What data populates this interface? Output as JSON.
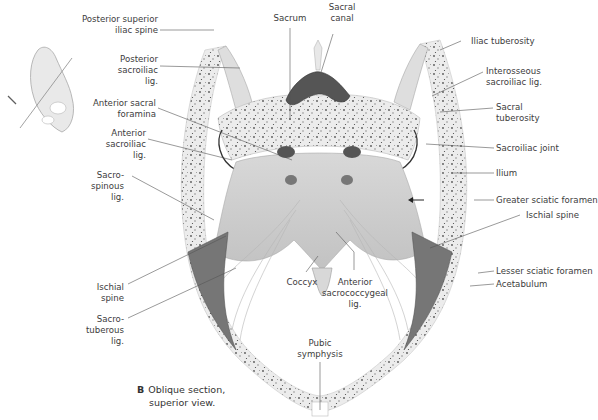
{
  "figure": {
    "panel_letter": "B",
    "caption_line1": "Oblique section,",
    "caption_line2": "superior view."
  },
  "labels_left": [
    {
      "id": "posterior-superior-iliac-spine",
      "lines": [
        "Posterior superior",
        "iliac spine"
      ]
    },
    {
      "id": "posterior-sacroiliac-lig",
      "lines": [
        "Posterior",
        "sacroiliac",
        "lig."
      ]
    },
    {
      "id": "anterior-sacral-foramina",
      "lines": [
        "Anterior sacral",
        "foramina"
      ]
    },
    {
      "id": "anterior-sacroiliac-lig",
      "lines": [
        "Anterior",
        "sacroiliac",
        "lig."
      ]
    },
    {
      "id": "sacrospinous-lig",
      "lines": [
        "Sacro-",
        "spinous",
        "lig."
      ]
    },
    {
      "id": "ischial-spine-left",
      "lines": [
        "Ischial",
        "spine"
      ]
    },
    {
      "id": "sacrotuberous-lig",
      "lines": [
        "Sacro-",
        "tuberous",
        "lig."
      ]
    }
  ],
  "labels_top": [
    {
      "id": "sacrum",
      "lines": [
        "Sacrum"
      ]
    },
    {
      "id": "sacral-canal",
      "lines": [
        "Sacral",
        "canal"
      ]
    }
  ],
  "labels_right": [
    {
      "id": "iliac-tuberosity",
      "lines": [
        "Iliac tuberosity"
      ]
    },
    {
      "id": "interosseous-sacroiliac-lig",
      "lines": [
        "Interosseous",
        "sacroiliac lig."
      ]
    },
    {
      "id": "sacral-tuberosity",
      "lines": [
        "Sacral",
        "tuberosity"
      ]
    },
    {
      "id": "sacroiliac-joint",
      "lines": [
        "Sacroiliac joint"
      ]
    },
    {
      "id": "ilium",
      "lines": [
        "Ilium"
      ]
    },
    {
      "id": "greater-sciatic-foramen",
      "lines": [
        "Greater sciatic foramen"
      ]
    },
    {
      "id": "ischial-spine-right",
      "lines": [
        "Ischial spine"
      ]
    },
    {
      "id": "lesser-sciatic-foramen",
      "lines": [
        "Lesser sciatic foramen"
      ]
    },
    {
      "id": "acetabulum",
      "lines": [
        "Acetabulum"
      ]
    }
  ],
  "labels_bottom": [
    {
      "id": "coccyx",
      "lines": [
        "Coccyx"
      ]
    },
    {
      "id": "anterior-sacrococcygeal-lig",
      "lines": [
        "Anterior",
        "sacrococcygeal",
        "lig."
      ]
    },
    {
      "id": "pubic-symphysis",
      "lines": [
        "Pubic",
        "symphysis"
      ]
    }
  ],
  "colors": {
    "bone": "#e9e9e9",
    "bone_speckle": "#5a5a5a",
    "ligament": "#cfcfcf",
    "muscle": "#6f6f6f",
    "canal": "#555555",
    "leader_line": "#555555"
  }
}
